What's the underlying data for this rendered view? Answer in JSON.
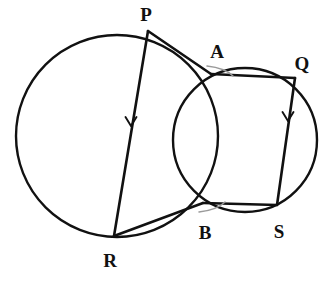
{
  "figure": {
    "background_color": "#ffffff",
    "stroke_color": "#111111",
    "angle_arc_color": "#9a9a9a",
    "width": 333,
    "height": 282
  },
  "points": {
    "P": {
      "label": "P",
      "x": 148,
      "y": 31,
      "label_x": 146,
      "label_y": 21
    },
    "A": {
      "label": "A",
      "x": 211,
      "y": 74,
      "label_x": 217,
      "label_y": 58
    },
    "Q": {
      "label": "Q",
      "x": 295,
      "y": 78,
      "label_x": 302,
      "label_y": 70
    },
    "B": {
      "label": "B",
      "x": 203,
      "y": 203,
      "label_x": 205,
      "label_y": 239
    },
    "S": {
      "label": "S",
      "x": 277,
      "y": 205,
      "label_x": 279,
      "label_y": 238
    },
    "R": {
      "label": "R",
      "x": 114,
      "y": 236,
      "label_x": 110,
      "label_y": 267
    }
  },
  "circles": [
    {
      "name": "large-circle",
      "cx": 117,
      "cy": 136,
      "r": 101
    },
    {
      "name": "small-circle",
      "cx": 245,
      "cy": 140,
      "r": 72
    }
  ],
  "segments": [
    {
      "name": "segment-PR",
      "from": "P",
      "to": "R",
      "arrow": true
    },
    {
      "name": "segment-QS",
      "from": "Q",
      "to": "S",
      "arrow": true
    },
    {
      "name": "segment-PA",
      "from": "P",
      "to": "A",
      "arrow": false
    },
    {
      "name": "segment-AQ",
      "from": "A",
      "to": "Q",
      "arrow": false
    },
    {
      "name": "segment-RB",
      "from": "R",
      "to": "B",
      "arrow": false
    },
    {
      "name": "segment-BS",
      "from": "B",
      "to": "S",
      "arrow": false
    }
  ],
  "arrow_markers": [
    {
      "name": "arrow-on-PR",
      "x": 131,
      "y": 126,
      "direction": "down"
    },
    {
      "name": "arrow-on-QS",
      "x": 288,
      "y": 121,
      "direction": "down"
    }
  ],
  "angle_arcs": [
    {
      "name": "angle-arc-at-A",
      "vertex": "A"
    },
    {
      "name": "angle-arc-at-B",
      "vertex": "B"
    }
  ]
}
